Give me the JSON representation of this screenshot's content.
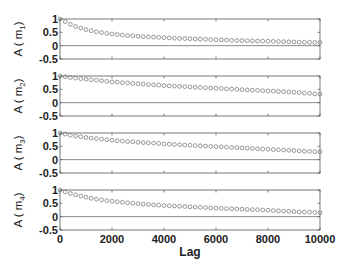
{
  "chart_data": {
    "type": "scatter",
    "layout": "4 vertically stacked subplots sharing x-axis",
    "xlabel": "Lag",
    "xlim": [
      0,
      10000
    ],
    "xticks": [
      0,
      2000,
      4000,
      6000,
      8000,
      10000
    ],
    "xtick_labels": [
      "0",
      "2000",
      "4000",
      "6000",
      "8000",
      "10000"
    ],
    "ylim": [
      -0.5,
      1
    ],
    "yticks": [
      -0.5,
      0,
      0.5,
      1
    ],
    "ytick_labels": [
      "-0.5",
      "0",
      "0.5",
      "1"
    ],
    "grid": false,
    "reference_line_y": 0,
    "marker": "open circle",
    "x": [
      0,
      200,
      400,
      600,
      800,
      1000,
      1200,
      1400,
      1600,
      1800,
      2000,
      2200,
      2400,
      2600,
      2800,
      3000,
      3200,
      3400,
      3600,
      3800,
      4000,
      4200,
      4400,
      4600,
      4800,
      5000,
      5200,
      5400,
      5600,
      5800,
      6000,
      6200,
      6400,
      6600,
      6800,
      7000,
      7200,
      7400,
      7600,
      7800,
      8000,
      8200,
      8400,
      8600,
      8800,
      9000,
      9200,
      9400,
      9600,
      9800,
      10000
    ],
    "series": [
      {
        "name": "m1",
        "ylabel": "A ( m",
        "ylabel_sub": "1",
        "values": [
          1.0,
          0.9,
          0.8,
          0.72,
          0.66,
          0.6,
          0.56,
          0.52,
          0.49,
          0.46,
          0.44,
          0.42,
          0.4,
          0.38,
          0.37,
          0.35,
          0.34,
          0.33,
          0.32,
          0.31,
          0.3,
          0.29,
          0.28,
          0.27,
          0.265,
          0.26,
          0.25,
          0.245,
          0.24,
          0.23,
          0.22,
          0.215,
          0.21,
          0.2,
          0.195,
          0.19,
          0.185,
          0.18,
          0.175,
          0.17,
          0.165,
          0.16,
          0.155,
          0.15,
          0.145,
          0.14,
          0.135,
          0.13,
          0.125,
          0.12,
          0.12
        ]
      },
      {
        "name": "m2",
        "ylabel": "A ( m",
        "ylabel_sub": "2",
        "values": [
          1.0,
          0.97,
          0.94,
          0.92,
          0.9,
          0.88,
          0.86,
          0.84,
          0.82,
          0.8,
          0.78,
          0.77,
          0.75,
          0.74,
          0.72,
          0.71,
          0.7,
          0.68,
          0.67,
          0.66,
          0.64,
          0.63,
          0.62,
          0.61,
          0.6,
          0.59,
          0.58,
          0.57,
          0.56,
          0.55,
          0.54,
          0.53,
          0.52,
          0.51,
          0.5,
          0.49,
          0.48,
          0.47,
          0.46,
          0.45,
          0.44,
          0.43,
          0.42,
          0.41,
          0.4,
          0.39,
          0.38,
          0.36,
          0.35,
          0.33,
          0.32
        ]
      },
      {
        "name": "m3",
        "ylabel": "A ( m",
        "ylabel_sub": "3",
        "values": [
          1.0,
          0.96,
          0.92,
          0.89,
          0.86,
          0.83,
          0.81,
          0.79,
          0.77,
          0.75,
          0.73,
          0.71,
          0.7,
          0.68,
          0.67,
          0.65,
          0.64,
          0.63,
          0.62,
          0.61,
          0.59,
          0.58,
          0.57,
          0.56,
          0.55,
          0.54,
          0.53,
          0.52,
          0.51,
          0.5,
          0.49,
          0.48,
          0.47,
          0.46,
          0.45,
          0.44,
          0.43,
          0.42,
          0.41,
          0.4,
          0.39,
          0.38,
          0.37,
          0.36,
          0.35,
          0.34,
          0.33,
          0.32,
          0.31,
          0.3,
          0.29
        ]
      },
      {
        "name": "m4",
        "ylabel": "A ( m",
        "ylabel_sub": "4",
        "values": [
          1.0,
          0.93,
          0.87,
          0.82,
          0.77,
          0.73,
          0.69,
          0.66,
          0.63,
          0.6,
          0.58,
          0.56,
          0.54,
          0.52,
          0.5,
          0.49,
          0.47,
          0.46,
          0.44,
          0.43,
          0.42,
          0.41,
          0.4,
          0.39,
          0.38,
          0.37,
          0.36,
          0.35,
          0.34,
          0.33,
          0.32,
          0.31,
          0.3,
          0.295,
          0.29,
          0.28,
          0.27,
          0.265,
          0.26,
          0.25,
          0.24,
          0.23,
          0.22,
          0.21,
          0.2,
          0.19,
          0.18,
          0.17,
          0.165,
          0.16,
          0.15
        ]
      }
    ]
  },
  "axis": {
    "xlabel": "Lag",
    "xtick_labels": [
      "0",
      "2000",
      "4000",
      "6000",
      "8000",
      "10000"
    ],
    "ytick_labels": [
      "1",
      "0.5",
      "0",
      "-0.5"
    ]
  },
  "colors": {
    "axes": "#555555",
    "marker": "#6f6f6f",
    "zero_line": "#8a8a8a",
    "text": "#222222"
  }
}
